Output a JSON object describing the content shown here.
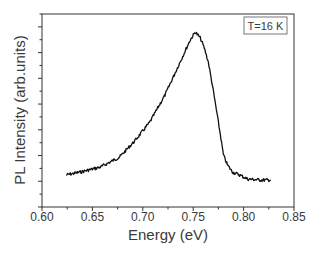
{
  "chart_data": {
    "type": "line",
    "title": "",
    "xlabel": "Energy (eV)",
    "ylabel": "PL Intensity (arb.units)",
    "xlim": [
      0.6,
      0.85
    ],
    "ylim": [
      0,
      1
    ],
    "xticks": [
      "0.60",
      "0.65",
      "0.70",
      "0.75",
      "0.80",
      "0.85"
    ],
    "xtick_values": [
      0.6,
      0.65,
      0.7,
      0.75,
      0.8,
      0.85
    ],
    "yticks_labeled": false,
    "grid": false,
    "legend": {
      "text": "T=16 K",
      "position": "top-right"
    },
    "series": [
      {
        "name": "PL spectrum",
        "color": "#111111",
        "x": [
          0.624,
          0.638,
          0.658,
          0.677,
          0.692,
          0.707,
          0.722,
          0.737,
          0.747,
          0.752,
          0.757,
          0.761,
          0.765,
          0.769,
          0.773,
          0.777,
          0.78,
          0.784,
          0.789,
          0.796,
          0.804,
          0.816,
          0.827
        ],
        "y": [
          0.166,
          0.181,
          0.207,
          0.259,
          0.342,
          0.44,
          0.58,
          0.751,
          0.865,
          0.907,
          0.876,
          0.824,
          0.751,
          0.632,
          0.503,
          0.373,
          0.269,
          0.218,
          0.181,
          0.166,
          0.145,
          0.14,
          0.14
        ]
      }
    ]
  },
  "labels": {
    "xlabel": "Energy (eV)",
    "ylabel": "PL Intensity (arb.units)",
    "legend": "T=16 K",
    "xticks": [
      "0.60",
      "0.65",
      "0.70",
      "0.75",
      "0.80",
      "0.85"
    ]
  }
}
